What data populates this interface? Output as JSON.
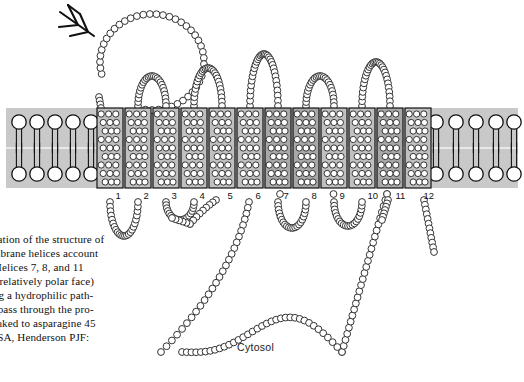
{
  "figure": {
    "cytosol_label": "Cytosol",
    "helix_numbers": [
      "1",
      "2",
      "3",
      "4",
      "5",
      "6",
      "7",
      "8",
      "9",
      "10",
      "11",
      "12"
    ],
    "glycan_icon": "branched-glycan-icon",
    "membrane": {
      "fill": "#c9c9c9",
      "top_y": 108,
      "bottom_y": 188,
      "leaflet_gap_y": 148
    },
    "helix_style": {
      "normal_fill": "#c0c0c0",
      "polar_fill": "#a8a8a8",
      "border": "#111111",
      "residue_fill": "#ffffff",
      "residue_stroke": "#222222"
    },
    "polar_helices": [
      "7",
      "8",
      "11"
    ],
    "residue_chain": {
      "circle_fill": "#ffffff",
      "circle_stroke": "#333333",
      "circle_radius": 3.4
    }
  },
  "caption": {
    "lines": [
      "representation of the structure of",
      "transmembrane helices account",
      "protein. Helices 7, 8, and 11",
      "have one relatively polar face)",
      "in forming a hydrophilic path-",
      "lecule to pass through the pro-",
      "in is N-linked to asparagine 45",
      "Baldwin SA, Henderson PJF:",
      "9.)"
    ]
  }
}
